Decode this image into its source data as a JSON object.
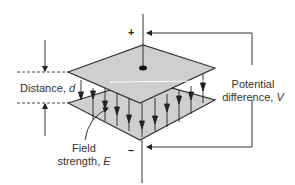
{
  "diagram": {
    "labels": {
      "distance": "Distance, ",
      "distance_var": "d",
      "potential_line1": "Potential",
      "potential_line2": "difference, ",
      "potential_var": "V",
      "field_line1": "Field",
      "field_line2": "strength, ",
      "field_var": "E",
      "plus": "+",
      "minus": "–"
    },
    "colors": {
      "plate_fill": "#cfcfcf",
      "stroke": "#333333",
      "background": "#ffffff"
    }
  }
}
